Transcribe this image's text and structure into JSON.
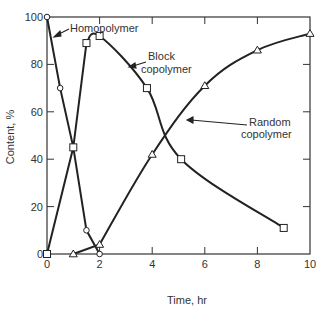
{
  "chart_data": {
    "type": "line",
    "title": "",
    "xlabel": "Time, hr",
    "ylabel": "Content, %",
    "xlim": [
      0,
      10
    ],
    "ylim": [
      0,
      100
    ],
    "xticks": [
      0,
      2,
      4,
      6,
      8,
      10
    ],
    "yticks": [
      0,
      20,
      40,
      60,
      80,
      100
    ],
    "grid": false,
    "legend": "none (inline annotations with arrows)",
    "series": [
      {
        "name": "Homopolymer",
        "marker": "circle",
        "x": [
          0,
          0.5,
          1,
          1.5,
          2
        ],
        "y": [
          100,
          70,
          45,
          10,
          0
        ]
      },
      {
        "name": "Block copolymer",
        "marker": "square",
        "x": [
          0,
          1,
          1.5,
          2,
          3.8,
          5.1,
          9
        ],
        "y": [
          0,
          45,
          89,
          92,
          70,
          40,
          11
        ]
      },
      {
        "name": "Random copolymer",
        "marker": "triangle",
        "x": [
          1,
          2,
          4,
          6,
          8,
          10
        ],
        "y": [
          0,
          4,
          42,
          71,
          86,
          93
        ]
      }
    ],
    "annotations": [
      {
        "text": "Homopolymer",
        "points_to_series": "Homopolymer"
      },
      {
        "text": "Block copolymer",
        "points_to_series": "Block copolymer"
      },
      {
        "text": "Random copolymer",
        "points_to_series": "Random copolymer"
      }
    ]
  },
  "labels": {
    "xlabel": "Time, hr",
    "ylabel": "Content, %",
    "homopolymer": "Homopolymer",
    "block_line1": "Block",
    "block_line2": "copolymer",
    "random_line1": "Random",
    "random_line2": "copolymer"
  }
}
